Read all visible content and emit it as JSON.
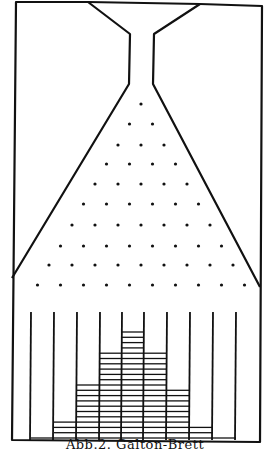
{
  "figure": {
    "caption": "Abb.2. Galton-Brett",
    "type": "galton-board",
    "ink_color": "#111111",
    "background": "#ffffff"
  },
  "board": {
    "frame": {
      "left": 12,
      "right": 260,
      "top": 2,
      "bottom": 440
    },
    "funnel": {
      "top_left": [
        88,
        2
      ],
      "top_right": [
        200,
        4
      ],
      "neck_left_top": [
        130,
        34
      ],
      "neck_right_top": [
        154,
        34
      ],
      "neck_left_bottom": [
        129,
        84
      ],
      "neck_right_bottom": [
        153,
        84
      ],
      "cone_left_bottom": [
        12,
        278
      ],
      "cone_right_bottom": [
        260,
        287
      ]
    },
    "peg_rows": 10,
    "peg_row_y": [
      104,
      124,
      145,
      164,
      184,
      204,
      225,
      246,
      265,
      285
    ],
    "peg_spacing": 23,
    "peg_center_x": 141
  },
  "bins": {
    "divider_x": [
      31,
      54,
      77,
      100,
      122,
      144,
      167,
      190,
      213,
      236
    ],
    "divider_top": 312,
    "floor_y": 440,
    "counts": [
      0,
      1,
      4,
      11,
      17,
      21,
      17,
      10,
      3,
      1,
      0
    ],
    "line_spacing": 5.3
  }
}
